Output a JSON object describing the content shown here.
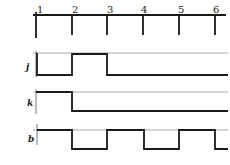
{
  "diagram": {
    "type": "timing-diagram",
    "clock": {
      "tick_labels": [
        "1",
        "2",
        "3",
        "4",
        "5",
        "6"
      ]
    },
    "signals": [
      {
        "name": "j",
        "levels": [
          0,
          1,
          0,
          0,
          0
        ]
      },
      {
        "name": "k",
        "levels": [
          1,
          0,
          0,
          0,
          0
        ]
      },
      {
        "name": "b",
        "levels": [
          1,
          0,
          1,
          0,
          1,
          0
        ]
      }
    ],
    "colors": {
      "trace": "#1a1a1a",
      "reference": "#888888"
    }
  }
}
